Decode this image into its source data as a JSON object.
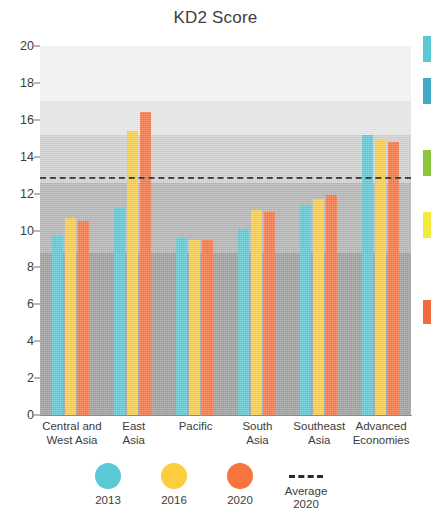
{
  "chart_data": {
    "type": "bar",
    "title": "KD2 Score",
    "xlabel": "",
    "ylabel": "",
    "ylim": [
      0,
      20
    ],
    "yticks": [
      0,
      2,
      4,
      6,
      8,
      10,
      12,
      14,
      16,
      18,
      20
    ],
    "grid": false,
    "legend_position": "bottom",
    "categories": [
      "Central and West Asia",
      "East Asia",
      "Pacific",
      "South Asia",
      "Southeast Asia",
      "Advanced Economies"
    ],
    "series": [
      {
        "name": "2013",
        "color": "#5bc8d6",
        "values": [
          9.7,
          11.2,
          9.6,
          10.1,
          11.4,
          15.2
        ]
      },
      {
        "name": "2016",
        "color": "#fccd3d",
        "values": [
          10.7,
          15.4,
          9.5,
          11.1,
          11.7,
          14.9
        ]
      },
      {
        "name": "2020",
        "color": "#f8743f",
        "values": [
          10.5,
          16.4,
          9.5,
          11.0,
          11.9,
          14.8
        ]
      }
    ],
    "annotations": [
      {
        "type": "hline",
        "label": "Average 2020",
        "value": 12.9,
        "style": "dashed",
        "color": "#2b2b2b"
      }
    ]
  },
  "axis": {
    "y_tick_labels": [
      "20",
      "18",
      "16",
      "14",
      "12",
      "10",
      "8",
      "6",
      "4",
      "2",
      "0"
    ],
    "x_tick_labels": [
      [
        "Central and",
        "West Asia"
      ],
      [
        "East",
        "Asia"
      ],
      [
        "Pacific",
        ""
      ],
      [
        "South",
        "Asia"
      ],
      [
        "Southeast",
        "Asia"
      ],
      [
        "Advanced",
        "Economies"
      ]
    ]
  },
  "legend": {
    "items": [
      {
        "label": "2013",
        "label2": "",
        "color": "#5bc8d6",
        "marker": "circle"
      },
      {
        "label": "2016",
        "label2": "",
        "color": "#fccd3d",
        "marker": "circle"
      },
      {
        "label": "2020",
        "label2": "",
        "color": "#f8743f",
        "marker": "circle"
      },
      {
        "label": "Average",
        "label2": "2020",
        "color": "#2b2b2b",
        "marker": "dashed-line"
      }
    ]
  },
  "background_bands": [
    {
      "from": 17.0,
      "to": 20.0,
      "color": "#f4f4f4"
    },
    {
      "from": 15.2,
      "to": 17.0,
      "color": "#e6e6e6"
    },
    {
      "from": 12.6,
      "to": 15.2,
      "color": "#cfcfcf"
    },
    {
      "from": 8.8,
      "to": 12.6,
      "color": "#b4b4b4"
    },
    {
      "from": 0.0,
      "to": 8.8,
      "color": "#9e9e9e"
    }
  ],
  "edge_swatches": [
    {
      "color": "#5bc8d6",
      "top": 36,
      "height": 26
    },
    {
      "color": "#3fa9c6",
      "top": 78,
      "height": 26
    },
    {
      "color": "#8cc63e",
      "top": 150,
      "height": 26
    },
    {
      "color": "#f2ea3c",
      "top": 212,
      "height": 26
    },
    {
      "color": "#f26b3a",
      "top": 300,
      "height": 24
    }
  ]
}
